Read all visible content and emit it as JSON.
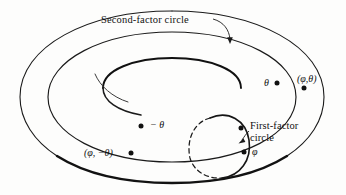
{
  "figure": {
    "background_color": "#fdfdfc",
    "ink_color": "#111111",
    "annotations": {
      "second_factor_label": "Second-factor circle",
      "first_factor_label_line1": "First-factor",
      "first_factor_label_line2": "circle",
      "theta_label": "θ",
      "neg_theta_label": "− θ",
      "phi_label": "φ",
      "point_phi_theta": "(φ,θ)",
      "point_phi_neg_theta": "(φ, −θ)"
    },
    "marked_points": [
      {
        "name": "theta-point",
        "label": "θ",
        "x": 277,
        "y": 83
      },
      {
        "name": "phi-theta-point",
        "label": "(φ,θ)",
        "x": 304,
        "y": 88
      },
      {
        "name": "neg-theta-point",
        "label": "− θ",
        "x": 141,
        "y": 126
      },
      {
        "name": "phi-neg-theta-point",
        "label": "(φ, −θ)",
        "x": 131,
        "y": 153
      },
      {
        "name": "phi-point",
        "label": "φ",
        "x": 244,
        "y": 152
      },
      {
        "name": "first-factor-top-point",
        "label": "",
        "x": 241,
        "y": 128
      }
    ]
  }
}
